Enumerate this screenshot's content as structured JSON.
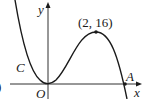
{
  "diagram": {
    "type": "function-graph",
    "curve_label": "C",
    "origin_label": "O",
    "x_axis_label": "x",
    "y_axis_label": "y",
    "point_max_label": "(2, 16)",
    "point_a_label": "A",
    "edge_fragment": ")",
    "colors": {
      "stroke": "#1a1a1a",
      "background": "#ffffff"
    }
  }
}
